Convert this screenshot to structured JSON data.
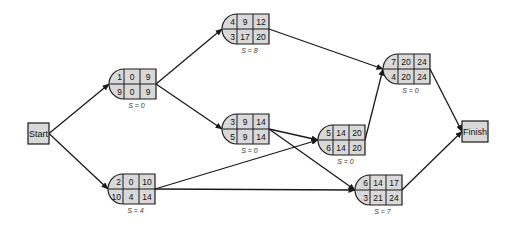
{
  "colors": {
    "node_fill": "#d9d9d9",
    "stroke": "#1a1a1a",
    "background": "#ffffff"
  },
  "terminals": {
    "start": {
      "label": "Start",
      "x": 28,
      "y": 123,
      "w": 21,
      "h": 21
    },
    "finish": {
      "label": "Finish",
      "x": 462,
      "y": 121,
      "w": 26,
      "h": 21
    }
  },
  "nodes": [
    {
      "id": "n1",
      "x": 109,
      "y": 69,
      "top": [
        "1",
        "0",
        "9"
      ],
      "bottom": [
        "9",
        "0",
        "9"
      ],
      "slack": "S = 0"
    },
    {
      "id": "n2",
      "x": 108,
      "y": 174,
      "top": [
        "2",
        "0",
        "10"
      ],
      "bottom": [
        "10",
        "4",
        "14"
      ],
      "slack": "S = 4"
    },
    {
      "id": "n3",
      "x": 222,
      "y": 114,
      "top": [
        "3",
        "9",
        "14"
      ],
      "bottom": [
        "5",
        "9",
        "14"
      ],
      "slack": "S = 0"
    },
    {
      "id": "n4",
      "x": 222,
      "y": 14,
      "top": [
        "4",
        "9",
        "12"
      ],
      "bottom": [
        "3",
        "17",
        "20"
      ],
      "slack": "S = 8"
    },
    {
      "id": "n5",
      "x": 318,
      "y": 125,
      "top": [
        "5",
        "14",
        "20"
      ],
      "bottom": [
        "6",
        "14",
        "20"
      ],
      "slack": "S = 0"
    },
    {
      "id": "n6",
      "x": 355,
      "y": 175,
      "top": [
        "6",
        "14",
        "17"
      ],
      "bottom": [
        "3",
        "21",
        "24"
      ],
      "slack": "S = 7"
    },
    {
      "id": "n7",
      "x": 383,
      "y": 54,
      "top": [
        "7",
        "20",
        "24"
      ],
      "bottom": [
        "4",
        "20",
        "24"
      ],
      "slack": "S = 0"
    }
  ],
  "edges": [
    {
      "from": "start",
      "to": "n1"
    },
    {
      "from": "start",
      "to": "n2"
    },
    {
      "from": "n1",
      "to": "n4"
    },
    {
      "from": "n1",
      "to": "n3"
    },
    {
      "from": "n4",
      "to": "n7"
    },
    {
      "from": "n3",
      "to": "n5"
    },
    {
      "from": "n3",
      "to": "n6"
    },
    {
      "from": "n2",
      "to": "n5"
    },
    {
      "from": "n2",
      "to": "n6"
    },
    {
      "from": "n5",
      "to": "n7"
    },
    {
      "from": "n7",
      "to": "finish"
    },
    {
      "from": "n6",
      "to": "finish"
    }
  ]
}
